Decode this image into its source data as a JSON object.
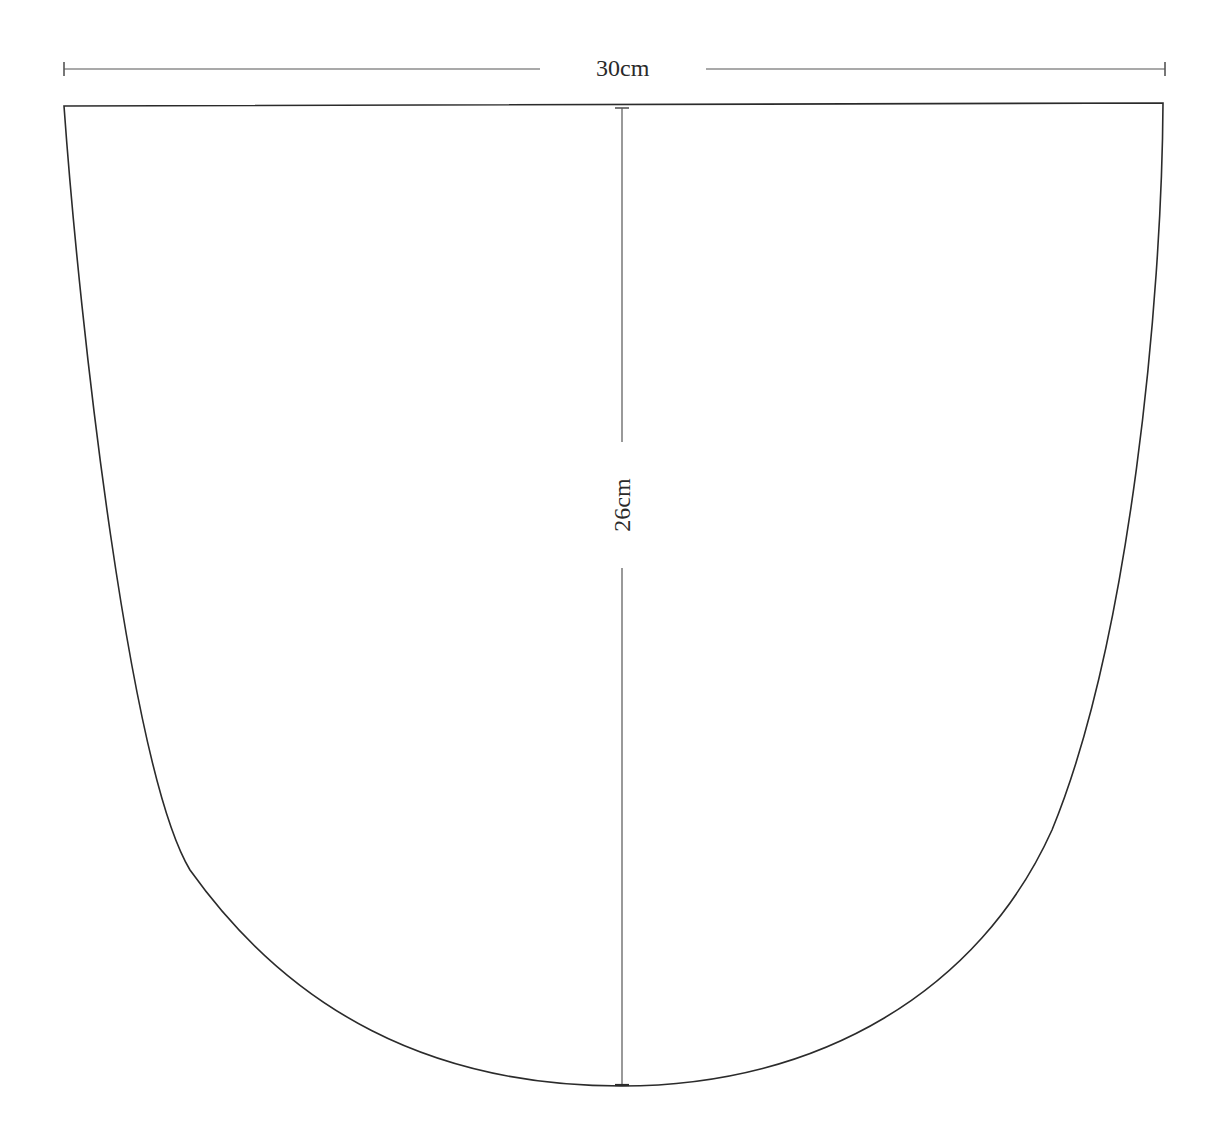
{
  "diagram": {
    "type": "sewing-pattern-piece",
    "shape": "rounded-bottom panel (straight top edge, curved sides and bottom)",
    "colors": {
      "outline": "#2b2b2b",
      "dimension_line": "#555555",
      "background": "#ffffff",
      "text": "#2a2a2a"
    },
    "dimensions": {
      "width": {
        "label": "30cm",
        "orientation": "horizontal",
        "position": "above top edge"
      },
      "height": {
        "label": "26cm",
        "orientation": "vertical",
        "position": "center line from top edge to bottom of curve"
      }
    }
  }
}
